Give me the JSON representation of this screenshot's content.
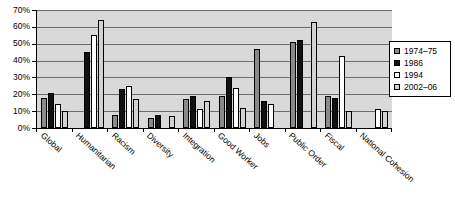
{
  "chart_data": {
    "type": "bar",
    "title": "",
    "xlabel": "",
    "ylabel": "",
    "ylim": [
      0,
      70
    ],
    "ytick_labels": [
      "70%",
      "60%",
      "50%",
      "40%",
      "30%",
      "20%",
      "10%",
      "0%"
    ],
    "ytick_values": [
      70,
      60,
      50,
      40,
      30,
      20,
      10,
      0
    ],
    "grid": true,
    "legend_position": "right",
    "categories": [
      "Global",
      "Humanitarian",
      "Racism",
      "Diversity",
      "Integration",
      "Good Worker",
      "Jobs",
      "Public Order",
      "Fiscal",
      "National Cohesion"
    ],
    "series": [
      {
        "name": "1974–75",
        "color": "#8a8a8a",
        "values": [
          18,
          0,
          8,
          6,
          17,
          19,
          47,
          51,
          19,
          0
        ]
      },
      {
        "name": "1986",
        "color": "#111111",
        "values": [
          21,
          45,
          23,
          8,
          19,
          30,
          16,
          52,
          18,
          0
        ]
      },
      {
        "name": "1994",
        "color": "#ffffff",
        "values": [
          14,
          55,
          25,
          0,
          11,
          24,
          14,
          0,
          43,
          11
        ]
      },
      {
        "name": "2002–06",
        "color": "#d2d2d2",
        "values": [
          10,
          64,
          17,
          7,
          16,
          12,
          0,
          63,
          10,
          10
        ]
      }
    ]
  }
}
